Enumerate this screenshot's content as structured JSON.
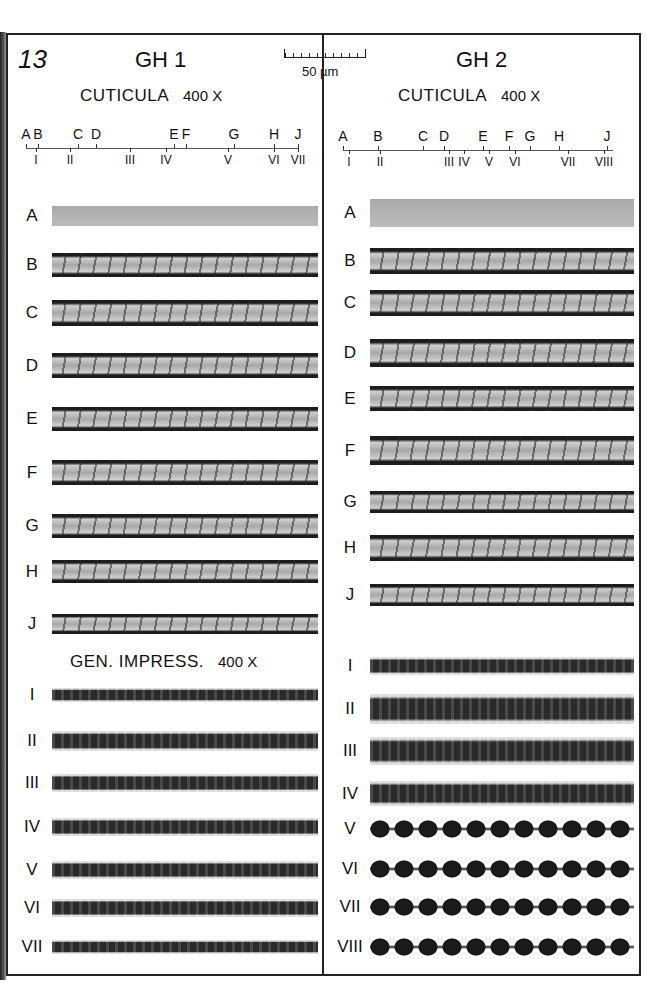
{
  "figure": {
    "number": "13",
    "scale_bar": {
      "label": "50 µm",
      "ticks": 10
    }
  },
  "columns": [
    {
      "title": "GH 1",
      "cuticula_heading": "CUTICULA",
      "cuticula_magnification": "400 X",
      "axis": {
        "top_labels": [
          "A",
          "B",
          "C",
          "D",
          "E",
          "F",
          "G",
          "H",
          "J"
        ],
        "bottom_labels": [
          "I",
          "II",
          "III",
          "IV",
          "V",
          "VI",
          "VII"
        ]
      },
      "cuticula_rows": [
        "A",
        "B",
        "C",
        "D",
        "E",
        "F",
        "G",
        "H",
        "J"
      ],
      "impress_heading": "GEN. IMPRESS.",
      "impress_magnification": "400 X",
      "impress_rows": [
        "I",
        "II",
        "III",
        "IV",
        "V",
        "VI",
        "VII"
      ]
    },
    {
      "title": "GH 2",
      "cuticula_heading": "CUTICULA",
      "cuticula_magnification": "400 X",
      "axis": {
        "top_labels": [
          "A",
          "B",
          "C",
          "D",
          "E",
          "F",
          "G",
          "H",
          "J"
        ],
        "bottom_labels": [
          "I",
          "II",
          "III",
          "IV",
          "V",
          "VI",
          "VII",
          "VIII"
        ]
      },
      "cuticula_rows": [
        "A",
        "B",
        "C",
        "D",
        "E",
        "F",
        "G",
        "H",
        "J"
      ],
      "impress_rows": [
        "I",
        "II",
        "III",
        "IV",
        "V",
        "VI",
        "VII",
        "VIII"
      ]
    }
  ]
}
